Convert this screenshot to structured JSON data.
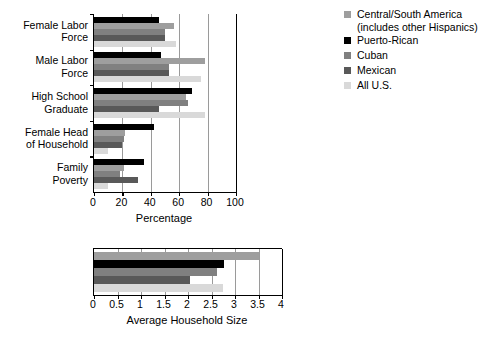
{
  "legend": {
    "position": "right",
    "items": [
      {
        "label": "Central/South America\n(includes other Hispanics)",
        "color": "#9e9e9e",
        "key": "central_south_america"
      },
      {
        "label": "Puerto-Rican",
        "color": "#000000",
        "key": "puerto_rican"
      },
      {
        "label": "Cuban",
        "color": "#808080",
        "key": "cuban"
      },
      {
        "label": "Mexican",
        "color": "#595959",
        "key": "mexican"
      },
      {
        "label": "All U.S.",
        "color": "#d9d9d9",
        "key": "all_us"
      }
    ]
  },
  "chart_data": [
    {
      "id": "percentage-chart",
      "type": "bar",
      "orientation": "horizontal",
      "title": "",
      "xlabel": "Percentage",
      "ylabel": "",
      "xlim": [
        0,
        100
      ],
      "xticks": [
        0,
        20,
        40,
        60,
        80,
        100
      ],
      "xticklabels": [
        "0",
        "20",
        "40",
        "60",
        "80",
        "100"
      ],
      "grid": true,
      "categories": [
        "Female Labor\nForce",
        "Male Labor\nForce",
        "High School\nGraduate",
        "Female Head\nof Household",
        "Family\nPoverty"
      ],
      "series": [
        {
          "name": "Puerto-Rican",
          "color": "#000000",
          "values": [
            46,
            47,
            69,
            42,
            35
          ]
        },
        {
          "name": "Central/South America\n(includes other Hispanics)",
          "color": "#9e9e9e",
          "values": [
            56,
            78,
            65,
            22,
            21
          ]
        },
        {
          "name": "Cuban",
          "color": "#808080",
          "values": [
            50,
            53,
            66,
            21,
            18
          ]
        },
        {
          "name": "Mexican",
          "color": "#595959",
          "values": [
            50,
            53,
            46,
            20,
            31
          ]
        },
        {
          "name": "All U.S.",
          "color": "#d9d9d9",
          "values": [
            58,
            75,
            78,
            10,
            10
          ]
        }
      ]
    },
    {
      "id": "household-size-chart",
      "type": "bar",
      "orientation": "horizontal",
      "title": "",
      "xlabel": "Average Household Size",
      "ylabel": "",
      "xlim": [
        0,
        4
      ],
      "xticks": [
        0,
        0.5,
        1,
        1.5,
        2,
        2.5,
        3,
        3.5,
        4
      ],
      "xticklabels": [
        "0",
        "0.5",
        "1",
        "1.5",
        "2",
        "2.5",
        "3",
        "3.5",
        "4"
      ],
      "grid": true,
      "categories": [
        ""
      ],
      "series": [
        {
          "name": "Central/South America\n(includes other Hispanics)",
          "color": "#9e9e9e",
          "values": [
            3.5
          ]
        },
        {
          "name": "Puerto-Rican",
          "color": "#000000",
          "values": [
            2.77
          ]
        },
        {
          "name": "Cuban",
          "color": "#808080",
          "values": [
            2.62
          ]
        },
        {
          "name": "Mexican",
          "color": "#595959",
          "values": [
            2.04
          ]
        },
        {
          "name": "All U.S.",
          "color": "#d9d9d9",
          "values": [
            2.75
          ]
        }
      ]
    }
  ]
}
